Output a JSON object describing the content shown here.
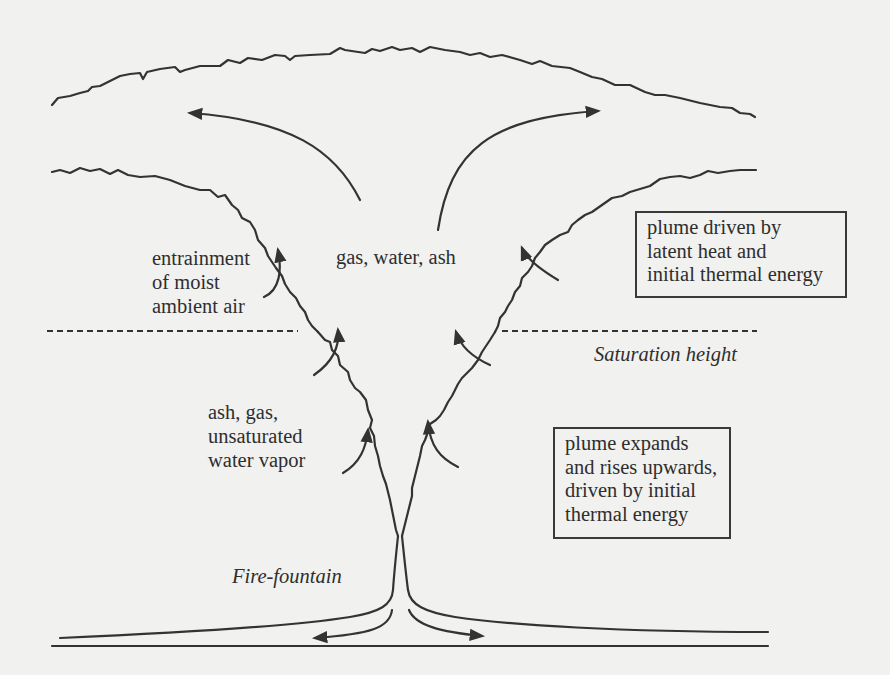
{
  "diagram": {
    "type": "volcanic-eruption-plume-schematic",
    "labels": {
      "gas_water_ash": "gas, water, ash",
      "entrainment": "entrainment\nof moist\nambient air",
      "ash_gas_vapor": "ash, gas,\nunsaturated\nwater vapor",
      "saturation_height": "Saturation height",
      "fire_fountain": "Fire-fountain"
    },
    "boxes": {
      "upper": "plume driven by\nlatent heat and\ninitial thermal energy",
      "lower": "plume expands\nand rises upwards,\ndriven by initial\nthermal energy"
    },
    "colors": {
      "background": "#f1f1ef",
      "line": "#333333",
      "text": "#2e2e2e"
    }
  }
}
